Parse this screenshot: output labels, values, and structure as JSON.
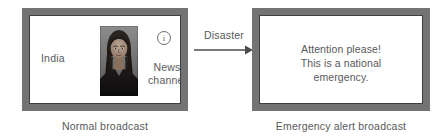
{
  "diagram": {
    "frame_color": "#737373",
    "inner_border_color": "#3f3f3f",
    "text_color": "#58595b",
    "screen_color": "#ffffff"
  },
  "left_tv": {
    "caption": "Normal broadcast",
    "country_label": "India",
    "info_icon_glyph": "i",
    "channel_label_line1": "News",
    "channel_label_line2": "channel",
    "portrait_alt": "news anchor portrait photograph"
  },
  "transition": {
    "label": "Disaster",
    "direction": "left-to-right"
  },
  "right_tv": {
    "caption": "Emergency alert broadcast",
    "message_line1": "Attention please!",
    "message_line2": "This is a national",
    "message_line3": "emergency."
  }
}
